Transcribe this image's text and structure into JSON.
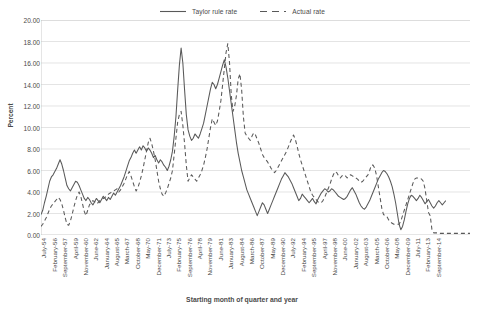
{
  "chart_data": {
    "type": "line",
    "title": "",
    "xlabel": "Starting month of quarter and year",
    "ylabel": "Percent",
    "ylim": [
      0,
      20
    ],
    "ytick_step": 2,
    "ytick_labels": [
      "0.00",
      "2.00",
      "4.00",
      "6.00",
      "8.00",
      "10.00",
      "12.00",
      "14.00",
      "16.00",
      "18.00",
      "20.00"
    ],
    "grid": "horizontal",
    "legend_position": "top-center",
    "x_tick_labels": [
      "July-54",
      "February-56",
      "September-57",
      "April-59",
      "November-60",
      "June-62",
      "January-64",
      "August-65",
      "March-67",
      "October-68",
      "May-70",
      "December-71",
      "July-73",
      "February-75",
      "September-76",
      "April-78",
      "November-79",
      "June-81",
      "January-83",
      "August-84",
      "March-86",
      "October-87",
      "May-89",
      "December-90",
      "July-92",
      "February-94",
      "September-95",
      "April-97",
      "November-98",
      "June-00",
      "January-02",
      "August-03",
      "March-05",
      "October-06",
      "May-08",
      "December-09",
      "July-11",
      "February-13",
      "September-14"
    ],
    "x_tick_interval_quarters": 6,
    "series": [
      {
        "name": "Taylor rule rate",
        "style": "solid",
        "color": "#595959",
        "values": [
          1.9,
          2.3,
          3.0,
          3.6,
          4.3,
          5.0,
          5.4,
          5.6,
          5.9,
          6.2,
          6.6,
          7.0,
          6.6,
          6.0,
          5.3,
          4.6,
          4.3,
          4.1,
          4.4,
          4.7,
          5.0,
          4.9,
          4.6,
          4.2,
          3.8,
          3.4,
          3.2,
          3.5,
          3.3,
          3.0,
          2.8,
          3.1,
          3.4,
          3.2,
          3.0,
          3.3,
          3.6,
          3.4,
          3.2,
          3.5,
          3.3,
          3.6,
          3.9,
          3.7,
          4.0,
          4.3,
          4.6,
          5.0,
          5.4,
          5.9,
          6.4,
          6.9,
          7.2,
          7.6,
          7.9,
          7.6,
          7.9,
          8.2,
          7.9,
          8.3,
          8.1,
          7.8,
          8.1,
          7.9,
          7.6,
          7.2,
          7.4,
          7.0,
          6.7,
          7.0,
          6.8,
          6.5,
          6.3,
          6.0,
          6.4,
          7.0,
          7.8,
          9.2,
          11.0,
          13.5,
          15.8,
          17.4,
          16.0,
          13.5,
          11.2,
          9.8,
          9.2,
          8.8,
          9.0,
          9.4,
          9.2,
          9.0,
          9.4,
          9.9,
          10.4,
          11.2,
          12.0,
          12.8,
          13.6,
          14.2,
          14.0,
          13.6,
          14.0,
          14.6,
          15.2,
          15.8,
          16.3,
          15.6,
          14.6,
          13.4,
          12.2,
          11.0,
          9.8,
          8.6,
          7.6,
          6.8,
          6.0,
          5.4,
          4.8,
          4.2,
          3.8,
          3.4,
          3.0,
          2.6,
          2.2,
          1.8,
          2.2,
          2.6,
          3.0,
          2.8,
          2.4,
          2.0,
          2.4,
          2.8,
          3.2,
          3.6,
          4.0,
          4.4,
          4.8,
          5.2,
          5.5,
          5.8,
          5.6,
          5.4,
          5.1,
          4.8,
          4.4,
          4.0,
          3.6,
          3.2,
          3.4,
          3.8,
          3.6,
          3.4,
          3.2,
          3.0,
          3.2,
          3.4,
          3.1,
          2.9,
          3.3,
          3.6,
          3.9,
          4.1,
          4.3,
          4.2,
          4.0,
          4.1,
          4.3,
          4.2,
          4.0,
          3.8,
          3.6,
          3.5,
          3.4,
          3.3,
          3.4,
          3.6,
          3.9,
          4.2,
          4.4,
          4.1,
          3.8,
          3.4,
          3.0,
          2.7,
          2.5,
          2.4,
          2.6,
          2.9,
          3.2,
          3.6,
          4.0,
          4.4,
          4.8,
          5.2,
          5.5,
          5.8,
          6.0,
          5.9,
          5.7,
          5.4,
          5.0,
          4.5,
          3.8,
          3.0,
          2.0,
          1.0,
          0.5,
          0.8,
          1.4,
          2.2,
          2.9,
          3.4,
          3.7,
          3.6,
          3.4,
          3.2,
          3.4,
          3.7,
          3.5,
          3.2,
          2.9,
          3.1,
          3.3,
          3.0,
          2.7,
          2.5,
          2.7,
          3.0,
          3.2,
          3.0,
          2.8,
          3.0,
          3.2
        ]
      },
      {
        "name": "Actual rate",
        "style": "dashed",
        "color": "#595959",
        "values": [
          0.8,
          1.0,
          1.3,
          1.6,
          2.0,
          2.4,
          2.7,
          2.9,
          3.1,
          3.3,
          3.5,
          3.3,
          2.9,
          2.3,
          1.6,
          1.0,
          0.9,
          1.3,
          1.9,
          2.6,
          3.2,
          3.7,
          4.0,
          3.6,
          2.9,
          2.2,
          1.8,
          2.3,
          2.8,
          3.0,
          3.2,
          3.1,
          2.9,
          3.0,
          3.2,
          3.3,
          3.4,
          3.5,
          3.6,
          3.8,
          3.9,
          4.0,
          4.1,
          4.2,
          4.3,
          4.0,
          4.2,
          4.5,
          4.8,
          5.2,
          5.6,
          5.9,
          5.5,
          5.0,
          4.5,
          4.1,
          4.4,
          4.9,
          5.5,
          6.2,
          7.0,
          7.8,
          8.6,
          9.0,
          8.5,
          7.8,
          7.0,
          6.0,
          5.0,
          4.3,
          3.8,
          3.6,
          3.9,
          4.3,
          4.8,
          5.3,
          6.0,
          7.5,
          9.0,
          10.5,
          11.2,
          11.5,
          10.2,
          8.5,
          6.5,
          5.0,
          5.3,
          5.6,
          5.4,
          5.2,
          5.0,
          5.3,
          5.6,
          6.0,
          6.5,
          7.2,
          8.0,
          9.0,
          10.0,
          10.8,
          10.5,
          10.2,
          10.6,
          11.5,
          12.5,
          14.0,
          15.5,
          17.0,
          17.8,
          16.0,
          13.0,
          11.5,
          12.0,
          13.0,
          14.5,
          15.0,
          13.5,
          11.0,
          9.5,
          9.2,
          9.0,
          8.8,
          9.2,
          9.5,
          9.3,
          8.9,
          8.5,
          8.0,
          7.5,
          7.2,
          7.0,
          6.8,
          6.5,
          6.2,
          6.0,
          5.8,
          6.0,
          6.3,
          6.6,
          6.9,
          7.2,
          7.5,
          7.8,
          8.2,
          8.6,
          9.0,
          9.3,
          8.9,
          8.3,
          7.6,
          7.0,
          6.5,
          6.0,
          5.5,
          5.0,
          4.5,
          4.0,
          3.7,
          3.5,
          3.3,
          3.1,
          3.0,
          3.0,
          3.2,
          3.5,
          3.9,
          4.3,
          4.7,
          5.2,
          5.6,
          5.9,
          5.8,
          5.5,
          5.3,
          5.5,
          5.6,
          5.5,
          5.3,
          5.5,
          5.6,
          5.5,
          5.4,
          5.3,
          5.2,
          5.0,
          4.9,
          5.0,
          5.2,
          5.4,
          5.6,
          6.0,
          6.5,
          6.5,
          6.2,
          5.5,
          4.5,
          3.5,
          2.5,
          1.9,
          1.8,
          1.7,
          1.4,
          1.2,
          1.1,
          1.0,
          1.0,
          1.0,
          1.0,
          1.3,
          1.8,
          2.3,
          2.8,
          3.3,
          3.8,
          4.3,
          4.8,
          5.2,
          5.3,
          5.3,
          5.3,
          5.2,
          5.0,
          4.3,
          3.2,
          2.1,
          1.8,
          0.5,
          0.2,
          0.2,
          0.2,
          0.15,
          0.15,
          0.15,
          0.15,
          0.15,
          0.15,
          0.15,
          0.15,
          0.15,
          0.15,
          0.15,
          0.15,
          0.15,
          0.15,
          0.15,
          0.15,
          0.15,
          0.15,
          0.15
        ]
      }
    ]
  },
  "legend": {
    "entries": [
      {
        "label": "Taylor rule rate"
      },
      {
        "label": "Actual rate"
      }
    ]
  },
  "axes": {
    "y_title": "Percent",
    "x_title": "Starting month of quarter and year"
  }
}
